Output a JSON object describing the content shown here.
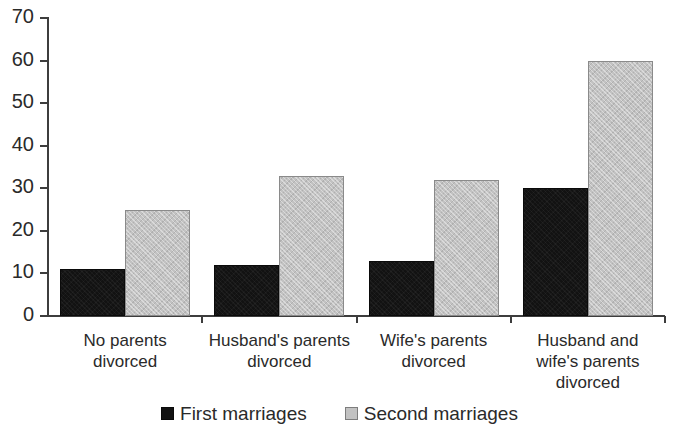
{
  "chart_data": {
    "type": "bar",
    "title": "",
    "subtitle": "",
    "xlabel": "",
    "ylabel": "",
    "ylim": [
      0,
      70
    ],
    "ytick_values": [
      0,
      10,
      20,
      30,
      40,
      50,
      60,
      70
    ],
    "ytick_labels": [
      "0",
      "10",
      "20",
      "30",
      "40",
      "50",
      "60",
      "70"
    ],
    "grid": false,
    "legend_position": "bottom-center",
    "categories": [
      "No parents divorced",
      "Husband's parents divorced",
      "Wife's parents divorced",
      "Husband and wife's parents divorced"
    ],
    "category_label_lines": [
      [
        "No parents",
        "divorced"
      ],
      [
        "Husband's parents",
        "divorced"
      ],
      [
        "Wife's parents",
        "divorced"
      ],
      [
        "Husband and",
        "wife's parents",
        "divorced"
      ]
    ],
    "series": [
      {
        "name": "First marriages",
        "color": "#121212",
        "values": [
          11,
          12,
          13,
          30
        ]
      },
      {
        "name": "Second marriages",
        "color": "#c2c2c2",
        "values": [
          25,
          33,
          32,
          60
        ]
      }
    ]
  },
  "legend": {
    "items": [
      {
        "label": "First marriages",
        "swatch": "black-square-swatch"
      },
      {
        "label": "Second marriages",
        "swatch": "gray-square-swatch"
      }
    ]
  },
  "axis": {
    "y_min_label": "0",
    "y_max_label": "70"
  }
}
